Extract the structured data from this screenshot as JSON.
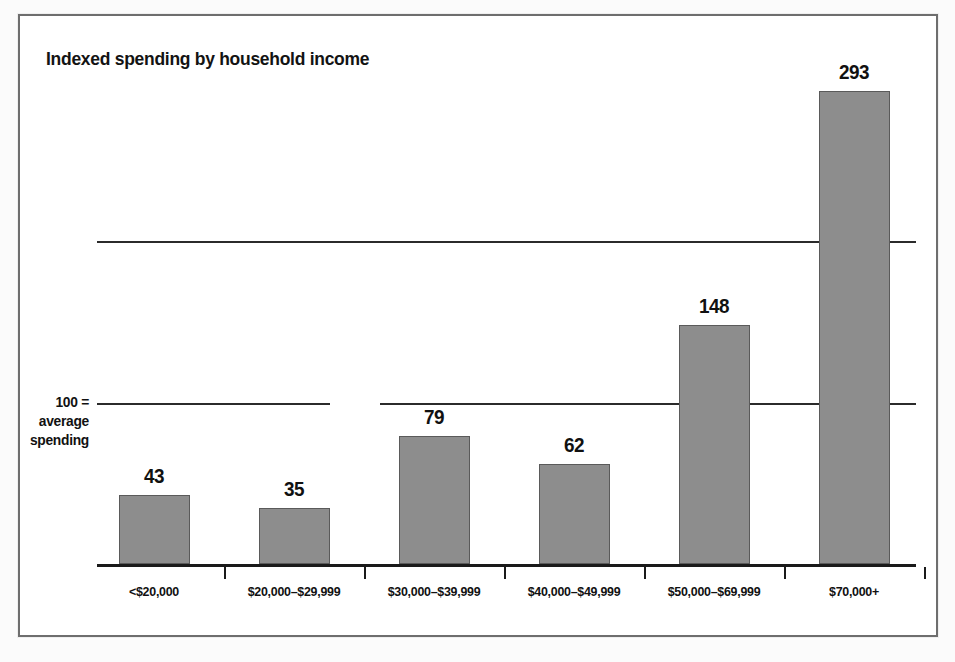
{
  "figure": {
    "title": "Indexed spending by household income",
    "baseline_note_lines": [
      "100 =",
      "average",
      "spending"
    ]
  },
  "chart_data": {
    "type": "bar",
    "title": "Indexed spending by household income",
    "xlabel": "",
    "ylabel": "",
    "categories": [
      "<$20,000",
      "$20,000–$29,999",
      "$30,000–$39,999",
      "$40,000–$49,999",
      "$50,000–$69,999",
      "$70,000+"
    ],
    "values": [
      43,
      35,
      79,
      62,
      148,
      293
    ],
    "value_labels": [
      "43",
      "35",
      "79",
      "62",
      "148",
      "293"
    ],
    "ylim": [
      0,
      320
    ],
    "gridlines": [
      100,
      200
    ],
    "grid": true,
    "legend": "none",
    "annotations": [
      "100 = average spending"
    ],
    "bar_color": "#8d8d8d",
    "bar_edge_color": "#5a5a5a",
    "axis_color": "#1a1a1a",
    "text_color": "#111111",
    "background": "#ffffff"
  }
}
